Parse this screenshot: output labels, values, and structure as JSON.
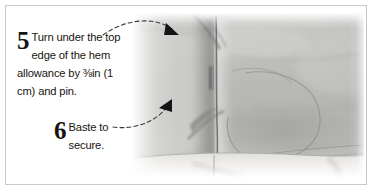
{
  "figure": {
    "border_color": "#c9c9c9",
    "background_color": "#ffffff"
  },
  "steps": [
    {
      "number": "5",
      "text": "Turn under the top edge of the hem allowance by ⅜in (1 cm) and pin.",
      "leader": "dashed-curve-with-arrowhead"
    },
    {
      "number": "6",
      "text": "Baste to secure.",
      "leader": "dashed-curve-with-arrowhead"
    }
  ],
  "photo": {
    "subject": "folded gray fabric hem with vertical seam and pin",
    "fabric_color": "#b9b9b7",
    "fabric_shadow_color": "#8d8d8c",
    "fabric_highlight_color": "#d8d8d6",
    "hem_edge_color": "#eceae6",
    "seam_line_color": "#6f6f6e"
  },
  "annotations": {
    "arrow_color": "#141414",
    "dash_color": "#3a3a3a",
    "arrow_top_label": "arrow pointing to turned-under top edge",
    "arrow_bottom_label": "arrow pointing to basting location"
  }
}
